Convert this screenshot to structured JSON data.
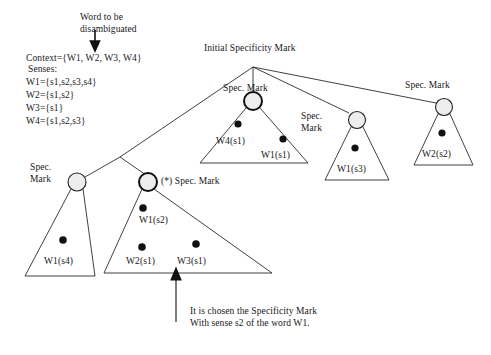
{
  "figure": {
    "type": "tree-diagram",
    "background_color": "#ffffff",
    "ink_color": "#1a1a1a",
    "node_fill": "#ededed"
  },
  "annotations": {
    "word_arrow_label": "Word to be\ndisambiguated",
    "initial_mark_label": "Initial Specificity Mark",
    "chosen_caption": "It is chosen the Specificity Mark\nWith sense s2 of the word W1.",
    "star_prefix": "(*) Spec. Mark"
  },
  "legend": {
    "context_line": "Context={W1, W2, W3, W4}",
    "senses_header": "Senses:",
    "senses": [
      "W1={s1,s2,s3,s4}",
      "W2={s1,s2}",
      "W3={s1}",
      "W4={s1,s2,s3}"
    ]
  },
  "mark_labels": {
    "top_center": "Spec. Mark",
    "mid_right_two_line": "Spec.\nMark",
    "far_right": "Spec. Mark",
    "bottom_left_two_line": "Spec.\nMark",
    "bottom_star": "(*) Spec. Mark"
  },
  "nodes": [
    {
      "id": "spec-mark-w4",
      "label": "Spec. Mark",
      "emphasis": "double-ring",
      "cx": 253,
      "cy": 101,
      "r": 9
    },
    {
      "id": "spec-mark-w1s3",
      "label": "Spec. Mark",
      "emphasis": "normal",
      "cx": 357,
      "cy": 120,
      "r": 8.5
    },
    {
      "id": "spec-mark-w2s2",
      "label": "Spec. Mark",
      "emphasis": "normal",
      "cx": 444,
      "cy": 107,
      "r": 8.5
    },
    {
      "id": "spec-mark-w1s4",
      "label": "Spec. Mark",
      "emphasis": "normal",
      "cx": 77,
      "cy": 182,
      "r": 9
    },
    {
      "id": "spec-mark-star",
      "label": "(*) Spec. Mark",
      "emphasis": "double-ring",
      "cx": 148,
      "cy": 182,
      "r": 9
    }
  ],
  "groups": [
    {
      "id": "group-w4",
      "senses": [
        "W4(s1)",
        "W1(s1)"
      ],
      "dots": 2
    },
    {
      "id": "group-w1s3",
      "senses": [
        "W1(s3)"
      ],
      "dots": 1
    },
    {
      "id": "group-w2s2",
      "senses": [
        "W2(s2)"
      ],
      "dots": 1
    },
    {
      "id": "group-w1s4",
      "senses": [
        "W1(s4)"
      ],
      "dots": 1
    },
    {
      "id": "group-star",
      "senses": [
        "W1(s2)",
        "W2(s1)",
        "W3(s1)"
      ],
      "dots": 3
    }
  ],
  "sense_labels": {
    "w4_s1": "W4(s1)",
    "w1_s1": "W1(s1)",
    "w1_s3": "W1(s3)",
    "w2_s2": "W2(s2)",
    "w1_s4": "W1(s4)",
    "w1_s2": "W1(s2)",
    "w2_s1": "W2(s1)",
    "w3_s1": "W3(s1)"
  }
}
